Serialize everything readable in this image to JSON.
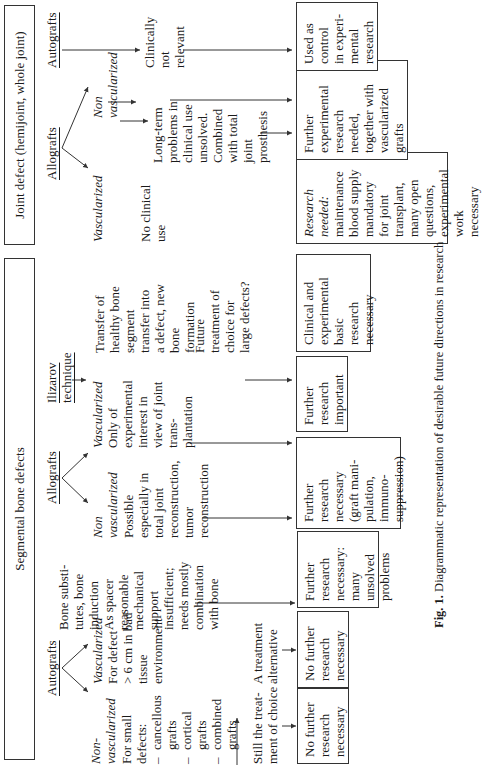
{
  "headers": {
    "segmental": "Segmental bone defects",
    "joint": "Joint defect (hemijoint, whole joint)"
  },
  "segmental": {
    "autografts": {
      "label": "Autografts",
      "non_vascularized": {
        "label": "Non-\nvascularized",
        "text": "For small\ndefects:",
        "items": [
          "cancellous\ngrafts",
          "cortical\ngrafts",
          "combined\ngrafts"
        ],
        "outcome": "Still the treat-\nment of choice",
        "box": "No further\nresearch\nnecessary"
      },
      "vascularized": {
        "label": "Vascularized",
        "text": "For defect\n> 6 cm in bad\ntissue\nenvironment",
        "outcome": "A treatment\nalternative",
        "box": "No further\nresearch\nnecessary"
      }
    },
    "bone_substitutes": {
      "text": "Bone substi-\ntutes, bone\ninduction\nAs spacer\nreasonable\nmechanical\nsupport\ninsufficient;\nneeds mostly\ncombination\nwith bone",
      "box": "Further\nresearch\nnecessary:\nmany\nunsolved\nproblems"
    },
    "allografts": {
      "label": "Allografts",
      "non_vascularized": {
        "label": "Non\nvascularized",
        "text": "Possible\nespecially in\ntotal joint\nreconstruction,\ntumor\nreconstruction",
        "box": "Further\nresearch\nnecessary\n(graft mani-\npulation,\nimmuno-\nsuppression)"
      },
      "vascularized": {
        "label": "Vascularized",
        "text": "Only of\nexperimental\ninterest in\nview of joint\ntrans-\nplantation",
        "box": "Further\nresearch\nimportant"
      }
    },
    "ilizarov": {
      "label": "Ilizarov\ntechnique",
      "text": "Transfer of\nhealthy bone\nsegment\ntransfer into\na defect, new\nbone\nformation",
      "outcome": "Future\ntreatment of\nchoice for\nlarge defects?",
      "box": "Clinical and\nexperimental\nbasic\nresearch\nnecessary"
    }
  },
  "joint": {
    "allografts": {
      "label": "Allografts",
      "vascularized": {
        "label": "Vascularized",
        "text": "No clinical\nuse",
        "box_title": "Research\nneeded:",
        "box": "maintenance\nblood supply\nmandatory\nfor joint\ntransplant,\nmany open\nquestions,\nexperimental\nwork\nnecessary"
      },
      "non_vascularized": {
        "label": "Non\nvascularized",
        "text": "Long-term\nproblems in\nclinical use\nunsolved.\nCombined\nwith total\njoint\nprosthesis",
        "box": "Further\nexperimental\nresearch\nneeded,\ntogether with\nvascularized\ngrafts"
      }
    },
    "autografts": {
      "label": "Autografts",
      "text": "Clinically\nnot\nrelevant",
      "box": "Used as\ncontrol\nin experi-\nmental\nresearch"
    }
  },
  "caption": {
    "label": "Fig. 1.",
    "text": " Diagrammatic representation of desirable future directions in research"
  }
}
